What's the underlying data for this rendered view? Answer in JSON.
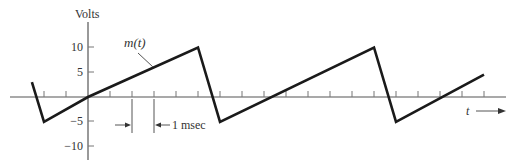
{
  "chart_data": {
    "type": "line",
    "title": "",
    "ylabel": "Volts",
    "xlabel": "t",
    "curve_label": "m(t)",
    "ylim": [
      -12,
      14
    ],
    "xlim": [
      -3.5,
      19
    ],
    "yticks": [
      10,
      5,
      -5,
      -10
    ],
    "ytick_labels": [
      "10",
      "5",
      "-5",
      "-10"
    ],
    "xtick_spacing_msec": 1,
    "xticks": [
      -2,
      -1,
      1,
      2,
      3,
      4,
      5,
      6,
      7,
      8,
      9,
      10,
      11,
      12,
      13,
      14,
      15,
      16,
      17,
      18
    ],
    "grid": false,
    "series": [
      {
        "name": "m(t)",
        "x": [
          -2.55,
          -2,
          0,
          5,
          6,
          13,
          14,
          18
        ],
        "y": [
          3,
          -5,
          0,
          10,
          -5,
          10,
          -5,
          4.5
        ]
      }
    ],
    "annotations": [
      {
        "text": "1 msec",
        "type": "dimension",
        "from": 2,
        "to": 3
      },
      {
        "text": "m(t)",
        "type": "leader",
        "target_t": 3
      }
    ]
  },
  "labels": {
    "y_axis": "Volts",
    "curve": "m(t)",
    "x_axis": "t",
    "interval": "1 msec",
    "y10": "10",
    "y5": "5",
    "yn5": "−5",
    "yn10": "−10"
  }
}
